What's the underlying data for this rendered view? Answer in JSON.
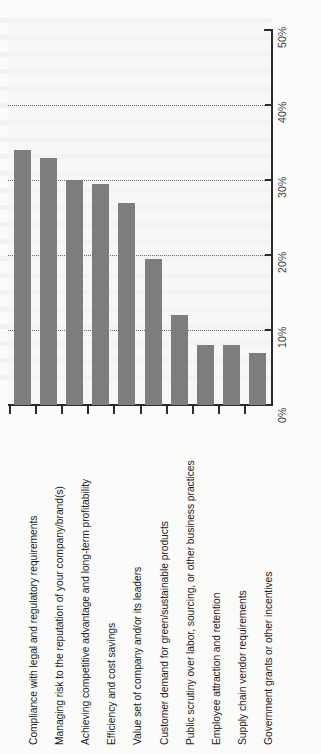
{
  "chart_data": {
    "type": "bar",
    "title": "",
    "subtitle": "",
    "xlabel": "",
    "ylabel": "",
    "orientation": "vertical-bars-rotated-page",
    "ylim": [
      0,
      50
    ],
    "ytick_values": [
      0,
      10,
      20,
      30,
      40,
      50
    ],
    "ytick_labels": [
      "0%",
      "10%",
      "20%",
      "30%",
      "40%",
      "50%"
    ],
    "grid": "horizontal-dotted",
    "legend": "none",
    "bar_color": "#7d7d7d",
    "axis_color": "#2b2b2b",
    "categories": [
      "Compliance with legal and regulatory requirements",
      "Managing risk to the reputation of your company/brand(s)",
      "Achieving competitive advantage and long-term profitability",
      "Efficiency and cost savings",
      "Value set of company and/or its leaders",
      "Customer demand for green/sustainable products",
      "Public scrutiny over labor, sourcing, or other business practices",
      "Employee attraction and retention",
      "Supply chain vendor requirements",
      "Government grants or other incentives"
    ],
    "values": [
      34,
      33,
      30,
      29.5,
      27,
      19.5,
      12,
      8,
      8,
      7
    ]
  }
}
